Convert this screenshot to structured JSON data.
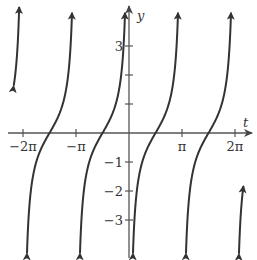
{
  "chart_data": {
    "type": "line",
    "title": "",
    "function": "y = tan(t + π/2) = -cot(t)",
    "xlabel": "t",
    "ylabel": "y",
    "x_ticks": [
      {
        "value": -6.2832,
        "label": "−2π"
      },
      {
        "value": -3.1416,
        "label": "−π"
      },
      {
        "value": 3.1416,
        "label": "π"
      },
      {
        "value": 6.2832,
        "label": "2π"
      }
    ],
    "y_ticks": [
      {
        "value": 3,
        "label": "3"
      },
      {
        "value": 2,
        "label": ""
      },
      {
        "value": 1,
        "label": ""
      },
      {
        "value": -1,
        "label": "−1"
      },
      {
        "value": -2,
        "label": "−2"
      },
      {
        "value": -3,
        "label": "−3"
      }
    ],
    "asymptotes_t": [
      -6.2832,
      -3.1416,
      0,
      3.1416,
      6.2832
    ],
    "zeros_t": [
      -4.7124,
      -1.5708,
      1.5708,
      4.7124
    ],
    "xlim": [
      -7.5,
      7.2
    ],
    "ylim": [
      -4.3,
      4.6
    ],
    "grid": false,
    "legend": null,
    "line_color": "#333333",
    "axis_color": "#555555",
    "arrows_on_curve_ends": true
  }
}
